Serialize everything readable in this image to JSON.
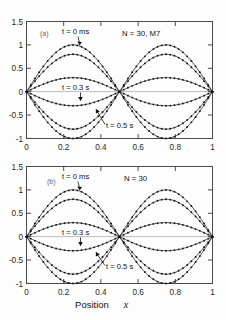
{
  "figure": {
    "xlabel": "Position x",
    "xlabel_plain": "Position",
    "xlabel_italic": "x"
  },
  "chart_data": [
    {
      "type": "line",
      "panel": "(a)",
      "title": "",
      "xlabel": "Position x",
      "ylabel": "",
      "condition": "N = 30, M7",
      "xlim": [
        0,
        1
      ],
      "ylim": [
        -1,
        1.5
      ],
      "xticks": [
        "0",
        "0.2",
        "0.4",
        "0.6",
        "0.8",
        "1"
      ],
      "xtick_values": [
        0,
        0.2,
        0.4,
        0.6,
        0.8,
        1
      ],
      "yticks": [
        "1.5",
        "1",
        "0.5",
        "0",
        "-0.5",
        "-1"
      ],
      "ytick_values": [
        1.5,
        1,
        0.5,
        0,
        -0.5,
        -1
      ],
      "grid": false,
      "legend": "none",
      "waveform": "sin(2*pi*x)",
      "nodes": [
        0,
        0.5,
        1
      ],
      "antinodes": [
        0.25,
        0.75
      ],
      "series": [
        {
          "name": "t = 0 ms (upper)",
          "amplitude": 1.0,
          "markers": true
        },
        {
          "name": "t = 0.1 s (upper)",
          "amplitude": 0.8,
          "markers": true
        },
        {
          "name": "t = 0.3 s (upper)",
          "amplitude": 0.3,
          "markers": true
        },
        {
          "name": "t = 0.3 s (lower)",
          "amplitude": -0.3,
          "markers": true
        },
        {
          "name": "t = 0.4 s (lower)",
          "amplitude": -0.8,
          "markers": true
        },
        {
          "name": "t = 0.5 s (lower)",
          "amplitude": -1.0,
          "markers": true
        }
      ],
      "annotations": [
        {
          "text": "t = 0 ms",
          "points_to_x": 0.25,
          "points_to_y": 1.0
        },
        {
          "text": "t = 0.3 s",
          "points_to_x": 0.27,
          "points_to_y": -0.3
        },
        {
          "text": "t = 0.5 s",
          "points_to_x": 0.43,
          "points_to_y": -0.35
        }
      ]
    },
    {
      "type": "line",
      "panel": "(b)",
      "title": "",
      "xlabel": "Position x",
      "ylabel": "",
      "condition": "N = 30",
      "xlim": [
        0,
        1
      ],
      "ylim": [
        -1,
        1.5
      ],
      "xticks": [
        "0",
        "0.2",
        "0.4",
        "0.6",
        "0.8",
        "1"
      ],
      "xtick_values": [
        0,
        0.2,
        0.4,
        0.6,
        0.8,
        1
      ],
      "yticks": [
        "1.5",
        "1",
        "0.5",
        "0",
        "-0.5",
        "-1"
      ],
      "ytick_values": [
        1.5,
        1,
        0.5,
        0,
        -0.5,
        -1
      ],
      "grid": false,
      "legend": "none",
      "waveform": "sin(2*pi*x)",
      "nodes": [
        0,
        0.5,
        1
      ],
      "antinodes": [
        0.25,
        0.75
      ],
      "series": [
        {
          "name": "t = 0 ms (upper)",
          "amplitude": 1.0,
          "markers": true
        },
        {
          "name": "t = 0.1 s (upper)",
          "amplitude": 0.8,
          "markers": true
        },
        {
          "name": "t = 0.3 s (upper)",
          "amplitude": 0.3,
          "markers": true
        },
        {
          "name": "t = 0.3 s (lower)",
          "amplitude": -0.3,
          "markers": true
        },
        {
          "name": "t = 0.4 s (lower)",
          "amplitude": -0.8,
          "markers": true
        },
        {
          "name": "t = 0.5 s (lower)",
          "amplitude": -1.0,
          "markers": true
        }
      ],
      "annotations": [
        {
          "text": "t = 0 ms",
          "points_to_x": 0.25,
          "points_to_y": 1.0
        },
        {
          "text": "t = 0.3 s",
          "points_to_x": 0.27,
          "points_to_y": -0.3
        },
        {
          "text": "t = 0.5 s",
          "points_to_x": 0.43,
          "points_to_y": -0.35
        }
      ]
    }
  ],
  "panel_a": {
    "label": "(a)",
    "condition": "N = 30, M7",
    "annot_t0": "t = 0 ms",
    "annot_t03": "t = 0.3 s",
    "annot_t05": "t = 0.5 s",
    "yticks": [
      "1.5",
      "1",
      "0.5",
      "0",
      "-0.5",
      "-1"
    ],
    "xticks": [
      "0",
      "0.2",
      "0.4",
      "0.6",
      "0.8",
      "1"
    ]
  },
  "panel_b": {
    "label": "(b)",
    "condition": "N = 30",
    "annot_t0": "t = 0 ms",
    "annot_t03": "t = 0.3 s",
    "annot_t05": "t = 0.5 s",
    "yticks": [
      "1.5",
      "1",
      "0.5",
      "0",
      "-0.5",
      "-1"
    ],
    "xticks": [
      "0",
      "0.2",
      "0.4",
      "0.6",
      "0.8",
      "1"
    ]
  }
}
